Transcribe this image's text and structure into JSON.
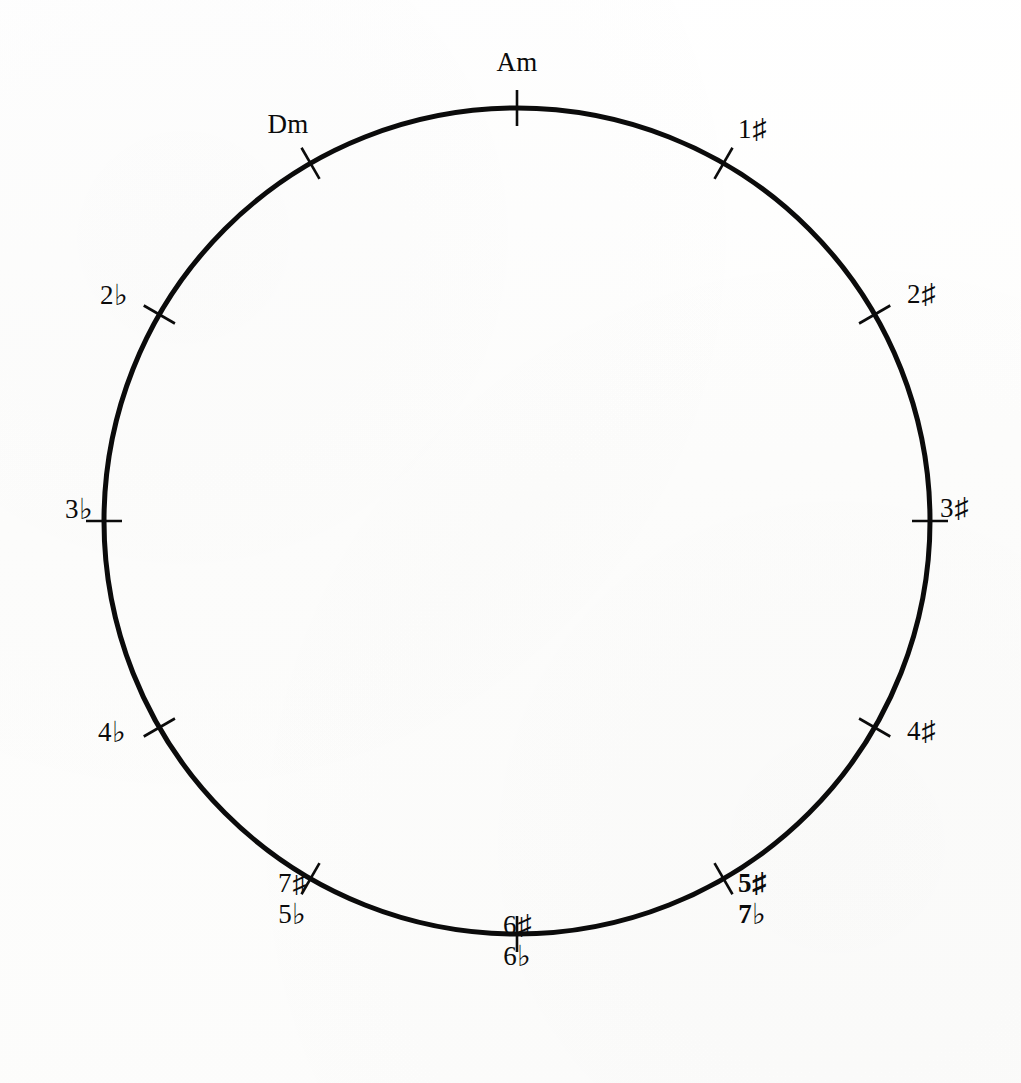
{
  "figure": {
    "kind": "circle-of-fifths-diagram",
    "background_color": "#fdfdfd",
    "ink_color": "#0b0b0b",
    "circle": {
      "center_x": 517,
      "center_y": 521,
      "radius": 413,
      "stroke_width": 5
    },
    "tick": {
      "inner_extent": 18,
      "outer_extent": 18,
      "stroke_width": 2.6,
      "count": 12,
      "angle_step_degrees": 30
    }
  },
  "chart_data": {
    "type": "scatter",
    "title": "",
    "xlabel": "",
    "ylabel": "",
    "layout": "radial",
    "grid": false,
    "legend": false,
    "angle_units": "degrees clockwise from top",
    "categories": [
      "Am",
      "1♯",
      "2♯",
      "3♯",
      "4♯",
      "5♯ / 7♭",
      "6♯ / 6♭",
      "7♯ / 5♭",
      "4♭",
      "3♭",
      "2♭",
      "Dm"
    ],
    "x": [
      0,
      30,
      60,
      90,
      120,
      150,
      180,
      210,
      240,
      270,
      300,
      330
    ],
    "values": [
      1,
      1,
      1,
      1,
      1,
      1,
      1,
      1,
      1,
      1,
      1,
      1
    ]
  },
  "marks": [
    {
      "id": "am",
      "angle": 0,
      "lines": [
        "Am"
      ],
      "bold": false,
      "label_x": 517,
      "label_y": 62,
      "align": "center"
    },
    {
      "id": "sharp-1",
      "angle": 30,
      "lines": [
        "1♯"
      ],
      "bold": false,
      "label_x": 752,
      "label_y": 129,
      "align": "center"
    },
    {
      "id": "sharp-2",
      "angle": 60,
      "lines": [
        "2♯"
      ],
      "bold": false,
      "label_x": 921,
      "label_y": 294,
      "align": "center"
    },
    {
      "id": "sharp-3",
      "angle": 90,
      "lines": [
        "3♯"
      ],
      "bold": false,
      "label_x": 954,
      "label_y": 508,
      "align": "center"
    },
    {
      "id": "sharp-4",
      "angle": 120,
      "lines": [
        "4♯"
      ],
      "bold": false,
      "label_x": 921,
      "label_y": 731,
      "align": "center"
    },
    {
      "id": "sharp-5-flat-7",
      "angle": 150,
      "lines": [
        "5♯",
        "7♭"
      ],
      "bold": true,
      "label_x": 752,
      "label_y": 898,
      "align": "center"
    },
    {
      "id": "sharp-6-flat-6",
      "angle": 180,
      "lines": [
        "6♯",
        "6♭"
      ],
      "bold": false,
      "label_x": 517,
      "label_y": 940,
      "align": "center"
    },
    {
      "id": "sharp-7-flat-5",
      "angle": 210,
      "lines": [
        "7♯",
        "5♭"
      ],
      "bold": false,
      "label_x": 292,
      "label_y": 898,
      "align": "center"
    },
    {
      "id": "flat-4",
      "angle": 240,
      "lines": [
        "4♭"
      ],
      "bold": false,
      "label_x": 112,
      "label_y": 731,
      "align": "center"
    },
    {
      "id": "flat-3",
      "angle": 270,
      "lines": [
        "3♭"
      ],
      "bold": false,
      "label_x": 79,
      "label_y": 508,
      "align": "center"
    },
    {
      "id": "flat-2",
      "angle": 300,
      "lines": [
        "2♭"
      ],
      "bold": false,
      "label_x": 114,
      "label_y": 294,
      "align": "center"
    },
    {
      "id": "dm",
      "angle": 330,
      "lines": [
        "Dm"
      ],
      "bold": false,
      "label_x": 288,
      "label_y": 124,
      "align": "center"
    }
  ]
}
